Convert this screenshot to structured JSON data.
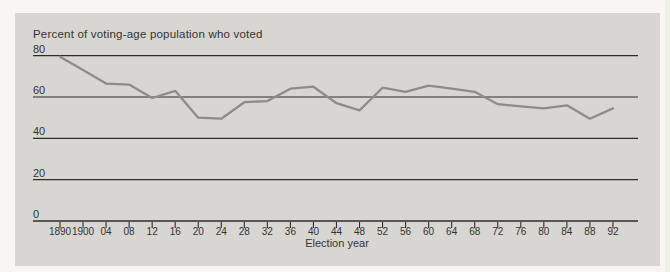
{
  "page": {
    "background": "#f7f6f2",
    "panel_background": "#d7d6d3"
  },
  "chart_data": {
    "type": "line",
    "title": "Percent of voting-age population who voted",
    "xlabel": "Election year",
    "ylabel": "",
    "categories": [
      "1890",
      "1900",
      "04",
      "08",
      "12",
      "16",
      "20",
      "24",
      "28",
      "32",
      "36",
      "40",
      "44",
      "48",
      "52",
      "56",
      "60",
      "64",
      "68",
      "72",
      "76",
      "80",
      "84",
      "88",
      "92"
    ],
    "values": [
      79.5,
      73,
      66.5,
      66,
      59.5,
      63,
      50,
      49.5,
      57.5,
      58,
      64,
      65,
      57,
      53.5,
      64.5,
      62.5,
      65.5,
      64,
      62.5,
      56.5,
      55.5,
      54.5,
      56,
      49.5,
      54.5
    ],
    "ylim": [
      0,
      80
    ],
    "yticks": [
      0,
      20,
      40,
      60,
      80
    ],
    "grid": "horizontal-only",
    "legend": "none",
    "colors": {
      "line": "#8d8c8a",
      "axis": "#2f2d2a",
      "text": "#35332f"
    }
  }
}
